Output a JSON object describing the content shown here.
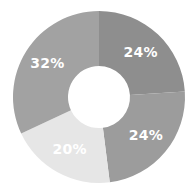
{
  "chart_data": {
    "type": "pie",
    "variant": "donut",
    "title": "",
    "legend": "none",
    "start_angle_deg": 0,
    "direction": "clockwise",
    "categories": [
      "Segment 1",
      "Segment 2",
      "Segment 3",
      "Segment 4"
    ],
    "values": [
      24,
      24,
      20,
      32
    ],
    "labels": [
      "24%",
      "24%",
      "20%",
      "32%"
    ],
    "colors": [
      "#8e8e8e",
      "#9c9c9c",
      "#e6e6e6",
      "#a2a2a2"
    ]
  },
  "geometry": {
    "cx": 99,
    "cy": 97,
    "outer_r": 86,
    "inner_r": 31,
    "label_r": 61
  }
}
